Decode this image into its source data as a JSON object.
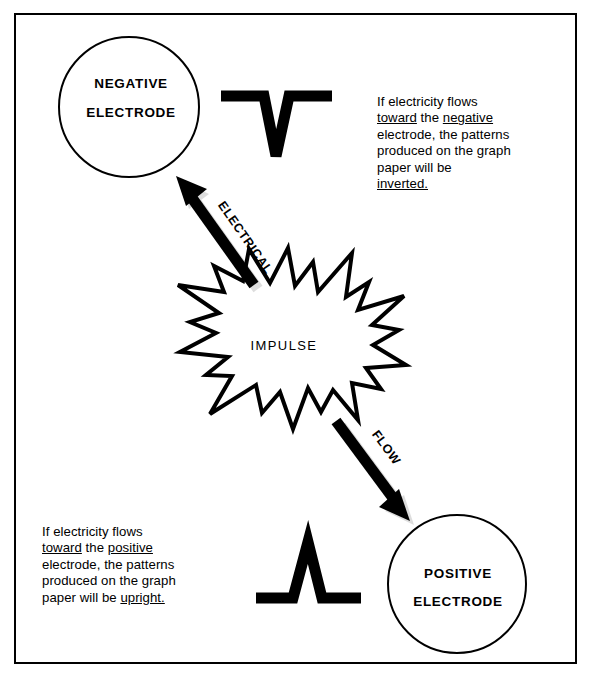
{
  "diagram": {
    "colors": {
      "ink": "#000000",
      "paper": "#ffffff"
    },
    "center_burst": {
      "label": "IMPULSE"
    },
    "electrodes": [
      {
        "id": "negative",
        "line1": "NEGATIVE",
        "line2": "ELECTRODE"
      },
      {
        "id": "positive",
        "line1": "POSITIVE",
        "line2": "ELECTRODE"
      }
    ],
    "arrows": [
      {
        "id": "up-arrow",
        "label": "ELECTRICAL",
        "direction": "toward-negative-electrode"
      },
      {
        "id": "down-arrow",
        "label": "FLOW",
        "direction": "toward-positive-electrode"
      }
    ],
    "waveforms": [
      {
        "id": "inverted-waveform",
        "shape": "inverted-v",
        "meaning": "inverted"
      },
      {
        "id": "upright-waveform",
        "shape": "upright-v",
        "meaning": "upright"
      }
    ],
    "captions": {
      "negative": {
        "segments": [
          {
            "text": "If electricity flows\n",
            "underline": false
          },
          {
            "text": "toward",
            "underline": true
          },
          {
            "text": " the ",
            "underline": false
          },
          {
            "text": "negative",
            "underline": true
          },
          {
            "text": "\nelectrode, the patterns\nproduced on the graph\npaper will be\n",
            "underline": false
          },
          {
            "text": "inverted.",
            "underline": true
          }
        ],
        "plain": "If electricity flows toward the negative electrode, the patterns produced on the graph paper will be inverted."
      },
      "positive": {
        "segments": [
          {
            "text": "If electricity flows\n",
            "underline": false
          },
          {
            "text": "toward",
            "underline": true
          },
          {
            "text": " the ",
            "underline": false
          },
          {
            "text": "positive",
            "underline": true
          },
          {
            "text": "\nelectrode, the patterns\nproduced on the graph\npaper will be ",
            "underline": false
          },
          {
            "text": "upright.",
            "underline": true
          }
        ],
        "plain": "If electricity flows toward the positive electrode, the patterns produced on the graph paper will be upright."
      }
    }
  }
}
